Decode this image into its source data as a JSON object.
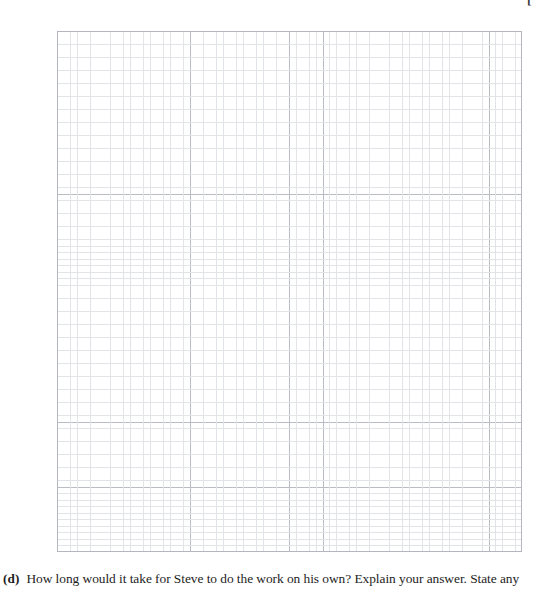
{
  "page": {
    "background_color": "#ffffff",
    "corner_mark": "["
  },
  "grid": {
    "name": "graph-paper-grid",
    "major_columns": 14,
    "major_rows": 16,
    "minor_per_major": 5,
    "major_line_color": "#b9bcc2",
    "minor_line_color": "#e2e4e8",
    "border_color": "#b4b7bd"
  },
  "question": {
    "label": "(d)",
    "text": "How long would it take for Steve to do the work on his own? Explain your answer. State any"
  }
}
